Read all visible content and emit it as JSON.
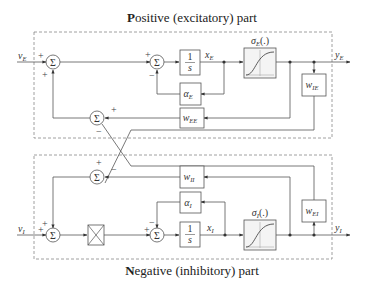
{
  "titles": {
    "positive_bold": "P",
    "positive_rest": "ositive (excitatory) part",
    "negative_bold": "N",
    "negative_rest": "egative (inhibitory) part"
  },
  "inputs": {
    "excitatory": "v",
    "excitatory_sub": "E",
    "inhibitory": "v",
    "inhibitory_sub": "I"
  },
  "outputs": {
    "excitatory": "y",
    "excitatory_sub": "E",
    "inhibitory": "y",
    "inhibitory_sub": "I"
  },
  "states": {
    "excitatory": "x",
    "excitatory_sub": "E",
    "inhibitory": "x",
    "inhibitory_sub": "I"
  },
  "blocks": {
    "sum_symbol": "Σ",
    "integrator_num": "1",
    "integrator_den": "s",
    "alpha_E": "α",
    "alpha_E_sub": "E",
    "alpha_I": "α",
    "alpha_I_sub": "I",
    "w_EE": "w",
    "w_EE_sub": "EE",
    "w_IE": "w",
    "w_IE_sub": "IE",
    "w_II": "w",
    "w_II_sub": "II",
    "w_EI": "w",
    "w_EI_sub": "EI",
    "sigma_E": "σ",
    "sigma_E_sub": "E",
    "sigma_E_arg": "(.)",
    "sigma_I": "σ",
    "sigma_I_sub": "I",
    "sigma_I_arg": "(.)"
  },
  "signs": {
    "plus": "+",
    "minus": "−"
  }
}
